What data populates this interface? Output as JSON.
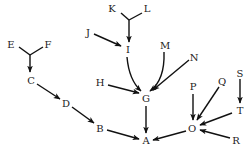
{
  "diagram": {
    "type": "directed-tree",
    "colors": {
      "edge": "#111111",
      "label": "#222222",
      "background": "#ffffff"
    },
    "nodes": [
      {
        "id": "A",
        "label": "A",
        "x": 146,
        "y": 140
      },
      {
        "id": "B",
        "label": "B",
        "x": 100,
        "y": 128
      },
      {
        "id": "C",
        "label": "C",
        "x": 31,
        "y": 80
      },
      {
        "id": "D",
        "label": "D",
        "x": 66,
        "y": 103
      },
      {
        "id": "E",
        "label": "E",
        "x": 11,
        "y": 44
      },
      {
        "id": "F",
        "label": "F",
        "x": 48,
        "y": 44
      },
      {
        "id": "G",
        "label": "G",
        "x": 146,
        "y": 98
      },
      {
        "id": "H",
        "label": "H",
        "x": 100,
        "y": 82
      },
      {
        "id": "I",
        "label": "I",
        "x": 128,
        "y": 49
      },
      {
        "id": "J",
        "label": "J",
        "x": 88,
        "y": 32
      },
      {
        "id": "K",
        "label": "K",
        "x": 112,
        "y": 8
      },
      {
        "id": "L",
        "label": "L",
        "x": 147,
        "y": 8
      },
      {
        "id": "M",
        "label": "M",
        "x": 165,
        "y": 45
      },
      {
        "id": "N",
        "label": "N",
        "x": 194,
        "y": 57
      },
      {
        "id": "O",
        "label": "O",
        "x": 192,
        "y": 128
      },
      {
        "id": "P",
        "label": "P",
        "x": 193,
        "y": 86
      },
      {
        "id": "Q",
        "label": "Q",
        "x": 222,
        "y": 81
      },
      {
        "id": "R",
        "label": "R",
        "x": 236,
        "y": 140
      },
      {
        "id": "S",
        "label": "S",
        "x": 240,
        "y": 73
      },
      {
        "id": "T",
        "label": "T",
        "x": 240,
        "y": 110
      }
    ],
    "edges": [
      {
        "from": "E",
        "to": "C",
        "merge": "EF"
      },
      {
        "from": "F",
        "to": "C",
        "merge": "EF"
      },
      {
        "from": "C",
        "to": "D"
      },
      {
        "from": "D",
        "to": "B"
      },
      {
        "from": "B",
        "to": "A"
      },
      {
        "from": "K",
        "to": "I",
        "merge": "KL"
      },
      {
        "from": "L",
        "to": "I",
        "merge": "KL"
      },
      {
        "from": "J",
        "to": "I"
      },
      {
        "from": "I",
        "to": "G",
        "curved": true
      },
      {
        "from": "H",
        "to": "G"
      },
      {
        "from": "M",
        "to": "G",
        "curved": true
      },
      {
        "from": "N",
        "to": "G"
      },
      {
        "from": "G",
        "to": "A"
      },
      {
        "from": "P",
        "to": "O"
      },
      {
        "from": "Q",
        "to": "O"
      },
      {
        "from": "S",
        "to": "T"
      },
      {
        "from": "T",
        "to": "O"
      },
      {
        "from": "R",
        "to": "O"
      },
      {
        "from": "O",
        "to": "A"
      }
    ]
  }
}
